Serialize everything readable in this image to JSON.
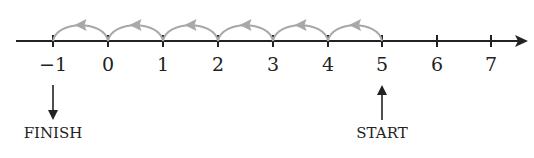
{
  "diagram": {
    "type": "number-line",
    "ticks": [
      "−1",
      "0",
      "1",
      "2",
      "3",
      "4",
      "5",
      "6",
      "7"
    ],
    "jumps": {
      "from": 5,
      "to": -1,
      "step": -1,
      "count": 6
    },
    "start": {
      "value": 5,
      "label": "START"
    },
    "finish": {
      "value": -1,
      "label": "FINISH"
    },
    "colors": {
      "axis": "#222222",
      "jump_arcs": "#a8a8a8"
    }
  }
}
